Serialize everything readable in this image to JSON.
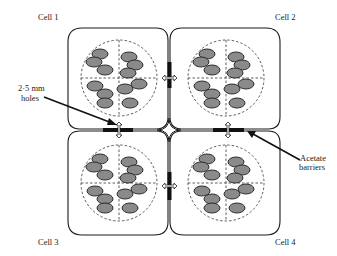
{
  "diagram": {
    "type": "four-cell chamber schematic",
    "cells": [
      {
        "id": "cell1",
        "label": "Cell 1",
        "center": [
          119,
          78
        ]
      },
      {
        "id": "cell2",
        "label": "Cell 2",
        "center": [
          226,
          78
        ]
      },
      {
        "id": "cell3",
        "label": "Cell 3",
        "center": [
          119,
          183
        ]
      },
      {
        "id": "cell4",
        "label": "Cell 4",
        "center": [
          226,
          183
        ]
      }
    ],
    "annotations": {
      "holes": {
        "line1": "2·5 mm",
        "line2": "holes"
      },
      "barriers": {
        "line1": "Acetate",
        "line2": "barriers"
      }
    },
    "eggs_per_quadrant": [
      2,
      3,
      3,
      2
    ],
    "colors": {
      "outline": "#1a1a1a",
      "egg_fill": "#8a8a8a",
      "barrier": "#111111",
      "background": "#ffffff"
    }
  }
}
